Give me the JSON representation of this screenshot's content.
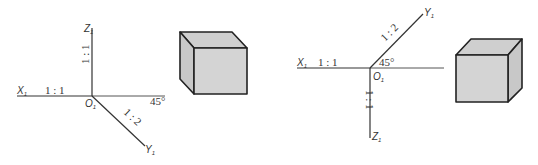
{
  "diagrams": [
    {
      "name": "oblique-axes-left",
      "axes": {
        "x_label": "X",
        "x_sub": "1",
        "z_label": "Z",
        "z_sub": "1",
        "y_label": "Y",
        "y_sub": "1",
        "origin_label": "O",
        "origin_sub": "1"
      },
      "ratios": {
        "x": "1 : 1",
        "z": "1 : 1",
        "y": "1 : 2"
      },
      "angle": "45°"
    },
    {
      "name": "oblique-axes-right",
      "axes": {
        "x_label": "X",
        "x_sub": "1",
        "z_label": "Z",
        "z_sub": "1",
        "y_label": "Y",
        "y_sub": "1",
        "origin_label": "O",
        "origin_sub": "1"
      },
      "ratios": {
        "x": "1 : 1",
        "z": "1 : 1",
        "y": "1 : 2"
      },
      "angle": "45°"
    }
  ],
  "colors": {
    "line": "#333333",
    "cube_fill": "#d4d4d4",
    "cube_edge": "#222222"
  }
}
